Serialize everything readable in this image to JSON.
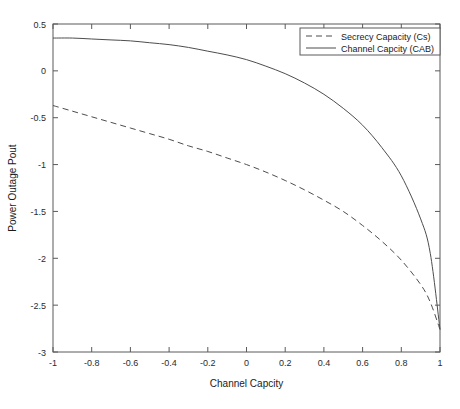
{
  "chart_data": {
    "type": "line",
    "title": "",
    "xlabel": "Channel Capcity",
    "ylabel": "Power Outage Pout",
    "xlim": [
      -1,
      1
    ],
    "ylim": [
      -3,
      0.5
    ],
    "grid": false,
    "legend_position": "top-right",
    "xticks": [
      -1,
      -0.8,
      -0.6,
      -0.4,
      -0.2,
      0,
      0.2,
      0.4,
      0.6,
      0.8,
      1
    ],
    "xticklabels": [
      "-1",
      "-0.8",
      "-0.6",
      "-0.4",
      "-0.2",
      "0",
      "0.2",
      "0.4",
      "0.6",
      "0.8",
      "1"
    ],
    "yticks": [
      0.5,
      0,
      -0.5,
      -1,
      -1.5,
      -2,
      -2.5,
      -3
    ],
    "yticklabels": [
      "0.5",
      "0",
      "-0.5",
      "-1",
      "-1.5",
      "-2",
      "-2.5",
      "-3"
    ],
    "series": [
      {
        "name": "Secrecy Capacity (Cs)",
        "style": "dashed",
        "color": "#4d4d4d",
        "x": [
          -1,
          -0.9,
          -0.8,
          -0.7,
          -0.6,
          -0.5,
          -0.4,
          -0.3,
          -0.2,
          -0.1,
          0,
          0.1,
          0.2,
          0.3,
          0.4,
          0.5,
          0.6,
          0.7,
          0.8,
          0.9,
          0.95,
          1
        ],
        "y": [
          -0.37,
          -0.43,
          -0.49,
          -0.55,
          -0.61,
          -0.67,
          -0.73,
          -0.8,
          -0.86,
          -0.93,
          -1.0,
          -1.08,
          -1.17,
          -1.27,
          -1.38,
          -1.5,
          -1.65,
          -1.82,
          -2.02,
          -2.28,
          -2.47,
          -2.76
        ]
      },
      {
        "name": "Channel Capcity (CAB)",
        "style": "solid",
        "color": "#4d4d4d",
        "x": [
          -1,
          -0.9,
          -0.8,
          -0.7,
          -0.6,
          -0.5,
          -0.4,
          -0.3,
          -0.2,
          -0.1,
          0,
          0.1,
          0.2,
          0.3,
          0.4,
          0.5,
          0.6,
          0.7,
          0.8,
          0.9,
          0.95,
          1
        ],
        "y": [
          0.35,
          0.35,
          0.34,
          0.33,
          0.32,
          0.3,
          0.28,
          0.25,
          0.21,
          0.17,
          0.12,
          0.05,
          -0.03,
          -0.13,
          -0.25,
          -0.4,
          -0.58,
          -0.82,
          -1.12,
          -1.58,
          -1.95,
          -2.76
        ]
      }
    ],
    "legend": [
      {
        "label": "Secrecy Capacity (Cs)",
        "style": "dashed"
      },
      {
        "label": "Channel Capcity (CAB)",
        "style": "solid"
      }
    ]
  }
}
